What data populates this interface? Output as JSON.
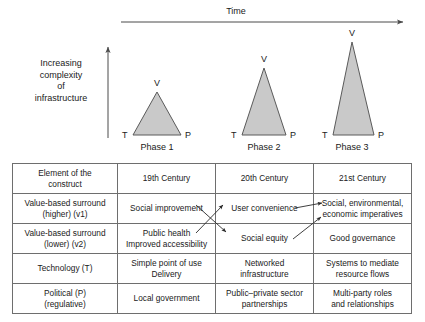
{
  "diagram": {
    "time_axis_label": "Time",
    "y_axis_label": "Increasing complexity of infrastructure",
    "y_axis_lines": [
      "Increasing",
      "complexity",
      "of",
      "infrastructure"
    ],
    "triangle_fill": "#c9c9c9",
    "triangle_stroke": "#5a5a5a",
    "phases": [
      {
        "name": "Phase 1",
        "apex_label": "V",
        "left_label": "T",
        "right_label": "P"
      },
      {
        "name": "Phase 2",
        "apex_label": "V",
        "left_label": "T",
        "right_label": "P"
      },
      {
        "name": "Phase 3",
        "apex_label": "V",
        "left_label": "T",
        "right_label": "P"
      }
    ]
  },
  "table": {
    "columns": [
      "Element of the construct",
      "19th Century",
      "20th Century",
      "21st Century"
    ],
    "column_lines": [
      [
        "Element of the",
        "construct"
      ],
      [
        "19th Century"
      ],
      [
        "20th Century"
      ],
      [
        "21st Century"
      ]
    ],
    "rows": [
      {
        "element_lines": [
          "Value-based surround",
          "(higher) (v1)"
        ],
        "c19_lines": [
          "Social improvement"
        ],
        "c20_lines": [
          "User convenience"
        ],
        "c21_lines": [
          "Social, environmental,",
          "economic imperatives"
        ]
      },
      {
        "element_lines": [
          "Value-based surround",
          "(lower) (v2)"
        ],
        "c19_lines": [
          "Public health",
          "Improved accessibility"
        ],
        "c20_lines": [
          "Social equity"
        ],
        "c21_lines": [
          "Good governance"
        ]
      },
      {
        "element_lines": [
          "Technology (T)"
        ],
        "c19_lines": [
          "Simple point of use",
          "Delivery"
        ],
        "c20_lines": [
          "Networked",
          "infrastructure"
        ],
        "c21_lines": [
          "Systems to mediate",
          "resource flows"
        ]
      },
      {
        "element_lines": [
          "Political (P)",
          "(regulative)"
        ],
        "c19_lines": [
          "Local government"
        ],
        "c20_lines": [
          "Public–private sector",
          "partnerships"
        ],
        "c21_lines": [
          "Multi-party roles",
          "and relationships"
        ]
      }
    ]
  }
}
